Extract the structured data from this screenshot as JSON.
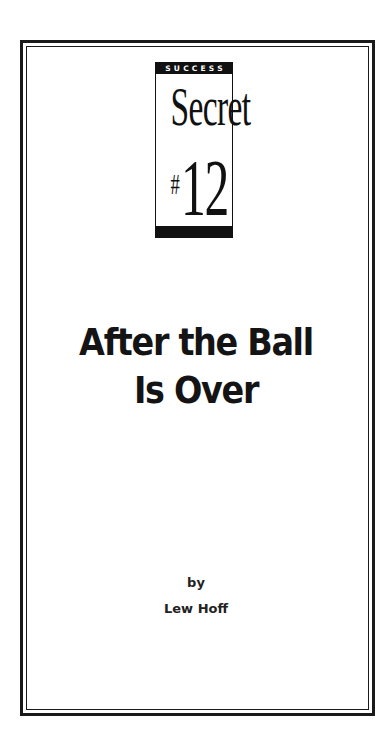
{
  "badge": {
    "label": "SUCCESS",
    "word": "Secret",
    "hash": "#",
    "number": "12"
  },
  "title": {
    "line1": "After the Ball",
    "line2": "Is Over"
  },
  "byline": {
    "by": "by",
    "author": "Lew Hoff"
  },
  "colors": {
    "ink": "#111111",
    "paper": "#ffffff"
  }
}
